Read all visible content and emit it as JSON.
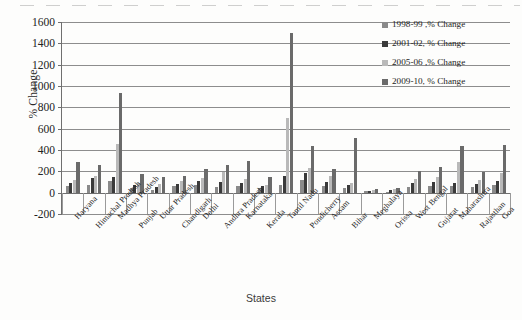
{
  "chart_data": {
    "type": "bar",
    "title": "",
    "xlabel": "States",
    "ylabel": "% Change",
    "ylim": [
      -200,
      1600
    ],
    "ytick_step": 200,
    "yticks": [
      -200,
      0,
      200,
      400,
      600,
      800,
      1000,
      1200,
      1400,
      1600
    ],
    "grid": true,
    "legend_position": "top-right",
    "categories": [
      "Haryana",
      "Himachal Pradesh",
      "Madhya Pradesh",
      "Punjab",
      "Uttar Pradesh",
      "Chandigarh",
      "Delhi",
      "Andhra Pradesh",
      "Karnataka",
      "Kerala",
      "Tamil Nadu",
      "Pondicherry",
      "Assam",
      "Bihar",
      "Meghalaya",
      "Orissa",
      "West Bengal",
      "Gujarat",
      "Maharashtra",
      "Rajasthan",
      "Goa"
    ],
    "series": [
      {
        "name": "1998-99 ,% Change",
        "color": "#8a8a8a",
        "values": [
          60,
          75,
          110,
          45,
          25,
          60,
          70,
          55,
          60,
          40,
          70,
          120,
          60,
          45,
          15,
          10,
          55,
          65,
          60,
          55,
          70
        ]
      },
      {
        "name": "2001-02, % Change",
        "color": "#3a3a3a",
        "values": [
          95,
          140,
          150,
          70,
          55,
          80,
          105,
          100,
          90,
          60,
          160,
          180,
          100,
          70,
          20,
          25,
          90,
          100,
          95,
          85,
          110
        ]
      },
      {
        "name": "2005-06 ,% Change",
        "color": "#b9b9b9",
        "values": [
          120,
          160,
          460,
          90,
          85,
          110,
          140,
          190,
          130,
          75,
          700,
          230,
          160,
          95,
          25,
          30,
          130,
          150,
          290,
          120,
          180
        ]
      },
      {
        "name": "2009-10, % Change",
        "color": "#6a6a6a",
        "values": [
          290,
          255,
          930,
          175,
          145,
          160,
          220,
          260,
          300,
          145,
          1500,
          440,
          220,
          510,
          35,
          45,
          205,
          240,
          440,
          190,
          450
        ]
      }
    ]
  }
}
